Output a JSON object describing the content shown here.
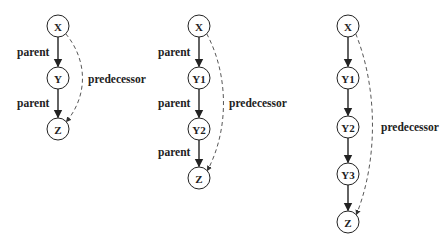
{
  "diagrams": [
    {
      "nodes": [
        {
          "id": "X",
          "label": "X",
          "x": 58,
          "y": 26
        },
        {
          "id": "Y",
          "label": "Y",
          "x": 58,
          "y": 78
        },
        {
          "id": "Z",
          "label": "Z",
          "x": 58,
          "y": 129
        }
      ],
      "parent_labels": [
        {
          "text": "parent",
          "x": 17,
          "y": 56
        },
        {
          "text": "parent",
          "x": 17,
          "y": 107
        }
      ],
      "predecessor_label": {
        "text": "predecessor",
        "x": 88,
        "y": 83
      }
    },
    {
      "nodes": [
        {
          "id": "X",
          "label": "X",
          "x": 199,
          "y": 26
        },
        {
          "id": "Y1",
          "label": "Y1",
          "x": 199,
          "y": 78
        },
        {
          "id": "Y2",
          "label": "Y2",
          "x": 199,
          "y": 129
        },
        {
          "id": "Z",
          "label": "Z",
          "x": 199,
          "y": 178
        }
      ],
      "parent_labels": [
        {
          "text": "parent",
          "x": 158,
          "y": 56
        },
        {
          "text": "parent",
          "x": 158,
          "y": 107
        },
        {
          "text": "parent",
          "x": 158,
          "y": 156
        }
      ],
      "predecessor_label": {
        "text": "predecessor",
        "x": 229,
        "y": 107
      }
    },
    {
      "nodes": [
        {
          "id": "X",
          "label": "X",
          "x": 348,
          "y": 26
        },
        {
          "id": "Y1",
          "label": "Y1",
          "x": 348,
          "y": 78
        },
        {
          "id": "Y2",
          "label": "Y2",
          "x": 348,
          "y": 127
        },
        {
          "id": "Y3",
          "label": "Y3",
          "x": 348,
          "y": 174
        },
        {
          "id": "Z",
          "label": "Z",
          "x": 348,
          "y": 222
        }
      ],
      "parent_labels": [],
      "predecessor_label": {
        "text": "predecessor",
        "x": 381,
        "y": 131
      }
    }
  ],
  "edge_types": {
    "parent": {
      "style": "solid",
      "color": "#222222"
    },
    "predecessor": {
      "style": "dashed",
      "color": "#444444"
    }
  }
}
